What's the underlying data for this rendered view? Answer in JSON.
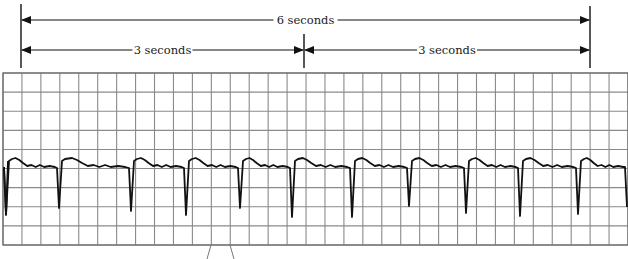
{
  "figure": {
    "type": "ecg-rhythm-strip"
  },
  "intervals": {
    "total": {
      "label": "6 seconds",
      "x_start": 21,
      "x_end": 590,
      "y": 20
    },
    "first_half": {
      "label": "3 seconds",
      "x_start": 21,
      "x_end": 304,
      "y": 50
    },
    "second_half": {
      "label": "3 seconds",
      "x_start": 304,
      "x_end": 590,
      "y": 50
    }
  },
  "markers": [
    {
      "x": 21,
      "y_top": 4,
      "y_bottom": 68
    },
    {
      "x": 304,
      "y_top": 34,
      "y_bottom": 68
    },
    {
      "x": 590,
      "y_top": 6,
      "y_bottom": 68
    }
  ],
  "grid": {
    "x": 3,
    "y": 73,
    "width": 625,
    "height": 172,
    "columns": 33,
    "rows": 9,
    "line_color": "#8a8a8a",
    "border_color": "#6e6e6e"
  },
  "trace": {
    "color": "#111111",
    "baseline_y": 167,
    "qrs_x": [
      6,
      59,
      131,
      186,
      240,
      292,
      352,
      409,
      466,
      520,
      578
    ],
    "qrs_depth_y": [
      215,
      208,
      211,
      215,
      208,
      217,
      217,
      206,
      213,
      216,
      214
    ],
    "qrs_count": 11
  },
  "annotations": {
    "tick_lines": [
      {
        "x1": 211,
        "y1": 245,
        "x2": 207,
        "y2": 259
      },
      {
        "x1": 230,
        "y1": 245,
        "x2": 234,
        "y2": 259
      }
    ]
  }
}
